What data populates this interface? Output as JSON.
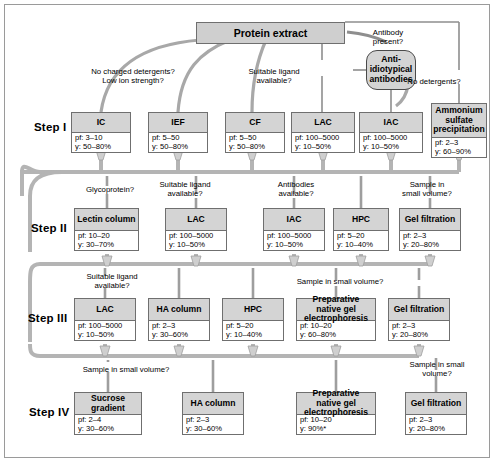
{
  "diagram": {
    "title_box": {
      "label": "Protein extract"
    },
    "pill": {
      "label": "Anti-\nidiotypical\nantibodies"
    },
    "step_labels": [
      "Step I",
      "Step II",
      "Step III",
      "Step IV"
    ],
    "decisions_top": [
      {
        "text": "No charged detergents?\nLow ion strength?",
        "x": 133,
        "y": 67
      },
      {
        "text": "Suitable ligand\navailable?",
        "x": 274,
        "y": 67
      },
      {
        "text": "Antibody\npresent?",
        "x": 388,
        "y": 28
      },
      {
        "text": "No detergents?",
        "x": 434,
        "y": 77
      }
    ],
    "decisions_step2": [
      {
        "text": "Glycoprotein?",
        "x": 110,
        "y": 185
      },
      {
        "text": "Suitable ligand\navailable?",
        "x": 185,
        "y": 180
      },
      {
        "text": "Antibodies\navailable?",
        "x": 296,
        "y": 180
      },
      {
        "text": "Sample in\nsmall volume?",
        "x": 427,
        "y": 180
      }
    ],
    "decisions_step3": [
      {
        "text": "Suitable ligand\navailable?",
        "x": 112,
        "y": 272
      },
      {
        "text": "Sample in small volume?",
        "x": 340,
        "y": 277
      }
    ],
    "decisions_step4": [
      {
        "text": "Sample in small volume?",
        "x": 126,
        "y": 365
      },
      {
        "text": "Sample in small\nvolume?",
        "x": 437,
        "y": 360
      }
    ],
    "rows": [
      {
        "step": "Step I",
        "label_y": 126,
        "box_y": 112,
        "title_h": 20,
        "nodes": [
          {
            "title": "IC",
            "pf": "pf: 3–10",
            "y": "y: 50–80%",
            "x": 71,
            "w": 60
          },
          {
            "title": "IEF",
            "pf": "pf: 5–50",
            "y": "y: 50–80%",
            "x": 148,
            "w": 60
          },
          {
            "title": "CF",
            "pf": "pf: 5–50",
            "y": "y: 50–80%",
            "x": 225,
            "w": 60
          },
          {
            "title": "LAC",
            "pf": "pf: 100–5000",
            "y": "y: 10–50%",
            "x": 291,
            "w": 64
          },
          {
            "title": "IAC",
            "pf": "pf: 100–5000",
            "y": "y: 10–50%",
            "x": 359,
            "w": 64
          },
          {
            "title": "Ammonium sulfate precipitation",
            "pf": "pf: 2–3",
            "y": "y: 60–90%",
            "x": 431,
            "w": 56,
            "title_h": 34,
            "box_y": 103
          }
        ]
      },
      {
        "step": "Step II",
        "label_y": 228,
        "box_y": 208,
        "title_h": 22,
        "nodes": [
          {
            "title": "Lectin column",
            "pf": "pf: 10–20",
            "y": "y: 30–70%",
            "x": 74,
            "w": 65
          },
          {
            "title": "LAC",
            "pf": "pf: 100–5000",
            "y": "y: 10–50%",
            "x": 165,
            "w": 62
          },
          {
            "title": "IAC",
            "pf": "pf: 100–5000",
            "y": "y: 10–50%",
            "x": 263,
            "w": 62
          },
          {
            "title": "HPC",
            "pf": "pf: 5–20",
            "y": "y: 10–40%",
            "x": 333,
            "w": 56
          },
          {
            "title": "Gel filtration",
            "pf": "pf: 2–3",
            "y": "y: 20–80%",
            "x": 399,
            "w": 62
          }
        ]
      },
      {
        "step": "Step III",
        "label_y": 318,
        "box_y": 298,
        "title_h": 22,
        "nodes": [
          {
            "title": "LAC",
            "pf": "pf: 100–5000",
            "y": "y: 10–50%",
            "x": 74,
            "w": 62
          },
          {
            "title": "HA column",
            "pf": "pf: 2–3",
            "y": "y: 30–60%",
            "x": 148,
            "w": 62
          },
          {
            "title": "HPC",
            "pf": "pf: 5–20",
            "y": "y: 10–40%",
            "x": 222,
            "w": 62
          },
          {
            "title": "Preparative native gel electrophoresis",
            "pf": "pf: 10–20",
            "y": "y: 60–80%",
            "x": 296,
            "w": 80
          },
          {
            "title": "Gel filtration",
            "pf": "pf: 2–3",
            "y": "y: 20–80%",
            "x": 388,
            "w": 62
          }
        ]
      },
      {
        "step": "Step IV",
        "label_y": 412,
        "box_y": 392,
        "title_h": 22,
        "nodes": [
          {
            "title": "Sucrose gradient",
            "pf": "pf: 2–4",
            "y": "y: 30–60%",
            "x": 74,
            "w": 68
          },
          {
            "title": "HA column",
            "pf": "pf: 2–3",
            "y": "y: 30–60%",
            "x": 182,
            "w": 62
          },
          {
            "title": "Preparative native gel electrophoresis",
            "pf": "pf: 10–20",
            "y": "y: 90%*",
            "x": 296,
            "w": 80
          },
          {
            "title": "Gel filtration",
            "pf": "pf: 2–3",
            "y": "y: 20–80%",
            "x": 405,
            "w": 62
          }
        ]
      }
    ]
  }
}
